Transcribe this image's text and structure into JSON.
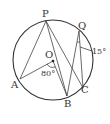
{
  "diagram": {
    "type": "circle-geometry",
    "circle": {
      "center": "O",
      "cx": 53,
      "cy": 60,
      "r": 40
    },
    "points": [
      {
        "name": "P",
        "x": 46,
        "y": 21,
        "label": "P",
        "lx": 42,
        "ly": 17
      },
      {
        "name": "Q",
        "x": 79,
        "y": 31,
        "label": "Q",
        "lx": 79,
        "ly": 30
      },
      {
        "name": "O",
        "x": 53,
        "y": 61,
        "label": "O",
        "lx": 46,
        "ly": 58
      },
      {
        "name": "A",
        "x": 20,
        "y": 79,
        "label": "A",
        "lx": 10,
        "ly": 87
      },
      {
        "name": "B",
        "x": 67,
        "y": 96,
        "label": "B",
        "lx": 64,
        "ly": 108
      },
      {
        "name": "C",
        "x": 83,
        "y": 88,
        "label": "C",
        "lx": 82,
        "ly": 94
      }
    ],
    "segments": [
      [
        "P",
        "A"
      ],
      [
        "P",
        "B"
      ],
      [
        "P",
        "C"
      ],
      [
        "A",
        "O"
      ],
      [
        "O",
        "B"
      ],
      [
        "Q",
        "B"
      ],
      [
        "Q",
        "C"
      ]
    ],
    "angles": [
      {
        "at": "O",
        "between": [
          "A",
          "B"
        ],
        "value": "80°",
        "lx": 41,
        "ly": 76
      },
      {
        "at": "Q",
        "between": [
          "B",
          "C"
        ],
        "value": "15°",
        "lx": 93,
        "ly": 54
      }
    ]
  }
}
